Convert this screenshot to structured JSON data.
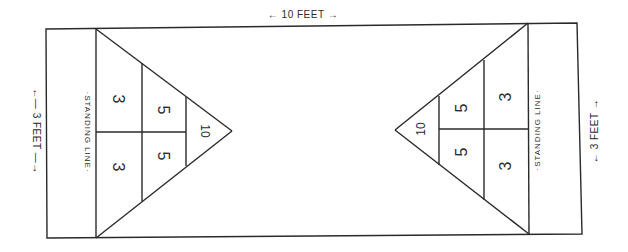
{
  "diagram": {
    "line_color": "#2a2a2a",
    "background": "#ffffff",
    "dimensions": {
      "length_label": "← 10 FEET →",
      "width_label_left": "←— 3 FEET —→",
      "width_label_right": "← 3 FEET →"
    },
    "left_end": {
      "standing_line_label": "·STANDING LINE·",
      "scores": {
        "outer_top": "3",
        "outer_bottom": "3",
        "middle_top": "5",
        "middle_bottom": "5",
        "tip": "10"
      }
    },
    "right_end": {
      "standing_line_label": "·STANDING LINE·",
      "scores": {
        "outer_top": "3",
        "outer_bottom": "3",
        "middle_top": "5",
        "middle_bottom": "5",
        "tip": "10"
      }
    }
  }
}
